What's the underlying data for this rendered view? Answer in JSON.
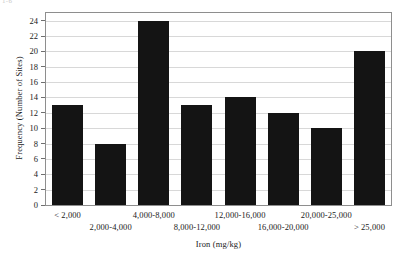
{
  "page": {
    "top_fragment": "1-6"
  },
  "chart_data": {
    "type": "bar",
    "title": "",
    "xlabel": "Iron (mg/kg)",
    "ylabel": "Frequency (Number of Sites)",
    "categories": [
      "< 2,000",
      "2,000-4,000",
      "4,000-8,000",
      "8,000-12,000",
      "12,000-16,000",
      "16,000-20,000",
      "20,000-25,000",
      "> 25,000"
    ],
    "values": [
      13,
      8,
      24,
      13,
      14,
      12,
      10,
      20
    ],
    "ylim": [
      0,
      25
    ],
    "yticks": [
      0,
      2,
      4,
      6,
      8,
      10,
      12,
      14,
      16,
      18,
      20,
      22,
      24
    ],
    "ytick_labels": [
      "0",
      "2",
      "4",
      "6",
      "8",
      "10",
      "12",
      "14",
      "16",
      "18",
      "20",
      "22",
      "24"
    ],
    "grid": true,
    "grid_axis": "y",
    "legend": false,
    "bar_color": "#141414",
    "axis_color": "#8e8e8e",
    "grid_color": "#d8d8d8",
    "xtick_label_rows": [
      0,
      1,
      0,
      1,
      0,
      1,
      0,
      1
    ]
  }
}
